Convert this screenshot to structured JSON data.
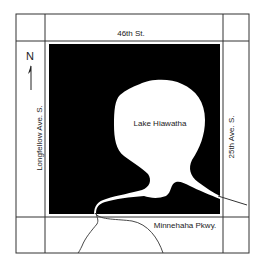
{
  "map": {
    "lake_name": "Lake Hiawatha",
    "north_label": "N",
    "streets": {
      "north": "46th St.",
      "west": "Longfellow Ave. S.",
      "east": "25th Ave. S.",
      "south": "Minnehaha Pkwy."
    },
    "colors": {
      "land": "#000000",
      "water": "#ffffff",
      "lines": "#333333",
      "text": "#222222"
    }
  }
}
